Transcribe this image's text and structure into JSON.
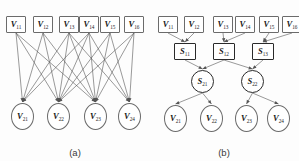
{
  "figure": {
    "width": 299,
    "height": 161,
    "stroke_color": "#6b6b6b",
    "bold_stroke_color": "#2a2a2a",
    "edge_color": "#555555",
    "background": "#fdfdfd"
  },
  "panel_a": {
    "caption": "(a)",
    "top_nodes": [
      {
        "name": "V",
        "sub": "11",
        "x": 6,
        "y": 16
      },
      {
        "name": "V",
        "sub": "12",
        "x": 33,
        "y": 16
      },
      {
        "name": "V",
        "sub": "13",
        "x": 59,
        "y": 16
      },
      {
        "name": "V",
        "sub": "14",
        "x": 79,
        "y": 16
      },
      {
        "name": "V",
        "sub": "15",
        "x": 100,
        "y": 16
      },
      {
        "name": "V",
        "sub": "16",
        "x": 124,
        "y": 16
      }
    ],
    "bottom_nodes": [
      {
        "name": "V",
        "sub": "21",
        "x": 11,
        "y": 103
      },
      {
        "name": "V",
        "sub": "22",
        "x": 47,
        "y": 103
      },
      {
        "name": "V",
        "sub": "23",
        "x": 84,
        "y": 103
      },
      {
        "name": "V",
        "sub": "24",
        "x": 118,
        "y": 103
      }
    ],
    "edges": [
      [
        0,
        0
      ],
      [
        0,
        1
      ],
      [
        0,
        2
      ],
      [
        1,
        0
      ],
      [
        1,
        1
      ],
      [
        1,
        2
      ],
      [
        2,
        0
      ],
      [
        2,
        1
      ],
      [
        2,
        2
      ],
      [
        2,
        3
      ],
      [
        3,
        0
      ],
      [
        3,
        1
      ],
      [
        3,
        2
      ],
      [
        3,
        3
      ],
      [
        4,
        1
      ],
      [
        4,
        2
      ],
      [
        4,
        3
      ],
      [
        5,
        1
      ],
      [
        5,
        2
      ],
      [
        5,
        3
      ]
    ]
  },
  "panel_b": {
    "caption": "(b)",
    "top_nodes": [
      {
        "name": "V",
        "sub": "11",
        "x": 9,
        "y": 16
      },
      {
        "name": "V",
        "sub": "12",
        "x": 35,
        "y": 16
      },
      {
        "name": "V",
        "sub": "13",
        "x": 64,
        "y": 16
      },
      {
        "name": "V",
        "sub": "14",
        "x": 86,
        "y": 16
      },
      {
        "name": "V",
        "sub": "15",
        "x": 110,
        "y": 16
      },
      {
        "name": "V",
        "sub": "16",
        "x": 133,
        "y": 16
      }
    ],
    "mid_square_nodes": [
      {
        "name": "S",
        "sub": "11",
        "x": 25,
        "y": 43
      },
      {
        "name": "S",
        "sub": "12",
        "x": 64,
        "y": 43
      },
      {
        "name": "S",
        "sub": "13",
        "x": 103,
        "y": 43
      }
    ],
    "mid_circle_nodes": [
      {
        "name": "S",
        "sub": "21",
        "x": 42,
        "y": 70
      },
      {
        "name": "S",
        "sub": "22",
        "x": 92,
        "y": 70
      }
    ],
    "bottom_nodes": [
      {
        "name": "V",
        "sub": "21",
        "x": 15,
        "y": 105
      },
      {
        "name": "V",
        "sub": "22",
        "x": 51,
        "y": 105
      },
      {
        "name": "V",
        "sub": "23",
        "x": 86,
        "y": 105
      },
      {
        "name": "V",
        "sub": "24",
        "x": 118,
        "y": 105
      }
    ],
    "edges_top_to_square": [
      [
        0,
        0
      ],
      [
        1,
        0
      ],
      [
        2,
        1
      ],
      [
        3,
        1
      ],
      [
        4,
        2
      ],
      [
        5,
        2
      ]
    ],
    "edges_square_to_circle": [
      [
        0,
        0
      ],
      [
        1,
        0
      ],
      [
        1,
        1
      ],
      [
        2,
        1
      ]
    ],
    "edges_circle_to_bottom": [
      [
        0,
        0
      ],
      [
        0,
        1
      ],
      [
        1,
        2
      ],
      [
        1,
        3
      ]
    ]
  }
}
